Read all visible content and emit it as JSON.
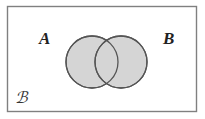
{
  "figure": {
    "type": "venn-diagram",
    "background_color": "#ffffff"
  },
  "universe": {
    "name": "sample-space",
    "label": "ℬ",
    "label_plain": "S",
    "border_color": "#808080",
    "fill_color": "#ffffff",
    "x": 7,
    "y": 6,
    "width": 189,
    "height": 105
  },
  "sets": [
    {
      "id": "A",
      "label": "A",
      "cx": 92,
      "cy": 62,
      "r": 26,
      "fill_color": "#d5d5d5",
      "stroke_color": "#555555",
      "label_x": 46,
      "label_y": 39
    },
    {
      "id": "B",
      "label": "B",
      "cx": 121,
      "cy": 62,
      "r": 26,
      "fill_color": "#d5d5d5",
      "stroke_color": "#555555",
      "label_x": 170,
      "label_y": 39
    }
  ],
  "shading": {
    "region": "union",
    "description": "Both circles shaded uniformly; intersection lens is the same tone.",
    "color": "#d5d5d5"
  },
  "chart_data": {
    "type": "diagram",
    "subtype": "venn",
    "title": "",
    "categories": [
      "A",
      "B"
    ],
    "sets": [
      "A",
      "B"
    ],
    "shaded_regions": [
      "A",
      "B",
      "A ∩ B"
    ],
    "universe_label": "S",
    "legend": []
  }
}
